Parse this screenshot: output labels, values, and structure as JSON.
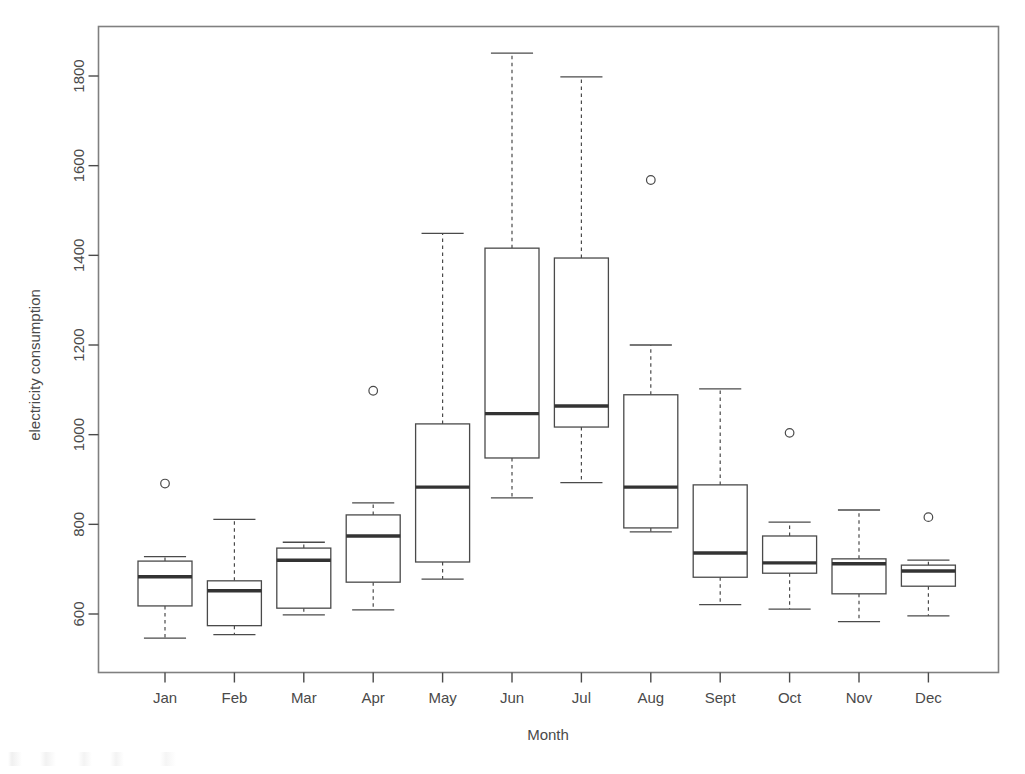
{
  "chart_data": {
    "type": "box",
    "title": "",
    "xlabel": "Month",
    "ylabel": "electricity consumption",
    "categories": [
      "Jan",
      "Feb",
      "Mar",
      "Apr",
      "May",
      "Jun",
      "Jul",
      "Aug",
      "Sept",
      "Oct",
      "Nov",
      "Dec"
    ],
    "ylim": [
      520,
      1880
    ],
    "yticks": [
      600,
      800,
      1000,
      1200,
      1400,
      1600,
      1800
    ],
    "ytick_labels": [
      "600",
      "800",
      "1000",
      "1200",
      "1400",
      "1600",
      "1800"
    ],
    "grid": false,
    "legend": "none",
    "box_color": "#ffffff",
    "line_color": "#4a4a4a",
    "median_color": "#3a3a3a",
    "whisker_style": "dashed",
    "boxes": [
      {
        "label": "Jan",
        "whisker_low": 546,
        "q1": 618,
        "median": 683,
        "q3": 718,
        "whisker_high": 728,
        "outliers": [
          891
        ]
      },
      {
        "label": "Feb",
        "whisker_low": 554,
        "q1": 574,
        "median": 652,
        "q3": 674,
        "whisker_high": 811,
        "outliers": []
      },
      {
        "label": "Mar",
        "whisker_low": 598,
        "q1": 613,
        "median": 720,
        "q3": 747,
        "whisker_high": 760,
        "outliers": []
      },
      {
        "label": "Apr",
        "whisker_low": 609,
        "q1": 671,
        "median": 774,
        "q3": 821,
        "whisker_high": 848,
        "outliers": [
          1098
        ]
      },
      {
        "label": "May",
        "whisker_low": 678,
        "q1": 716,
        "median": 883,
        "q3": 1024,
        "whisker_high": 1449,
        "outliers": []
      },
      {
        "label": "Jun",
        "whisker_low": 859,
        "q1": 948,
        "median": 1047,
        "q3": 1416,
        "whisker_high": 1851,
        "outliers": []
      },
      {
        "label": "Jul",
        "whisker_low": 893,
        "q1": 1017,
        "median": 1064,
        "q3": 1394,
        "whisker_high": 1798,
        "outliers": []
      },
      {
        "label": "Aug",
        "whisker_low": 783,
        "q1": 792,
        "median": 883,
        "q3": 1089,
        "whisker_high": 1200,
        "outliers": [
          1568
        ]
      },
      {
        "label": "Sept",
        "whisker_low": 621,
        "q1": 682,
        "median": 736,
        "q3": 888,
        "whisker_high": 1102,
        "outliers": []
      },
      {
        "label": "Oct",
        "whisker_low": 611,
        "q1": 691,
        "median": 714,
        "q3": 774,
        "whisker_high": 805,
        "outliers": [
          1004
        ]
      },
      {
        "label": "Nov",
        "whisker_low": 583,
        "q1": 645,
        "median": 712,
        "q3": 723,
        "whisker_high": 832,
        "outliers": []
      },
      {
        "label": "Dec",
        "whisker_low": 596,
        "q1": 662,
        "median": 696,
        "q3": 709,
        "whisker_high": 720,
        "outliers": [
          816
        ]
      }
    ]
  },
  "axes": {
    "x_title": "Month",
    "y_title": "electricity consumption"
  }
}
